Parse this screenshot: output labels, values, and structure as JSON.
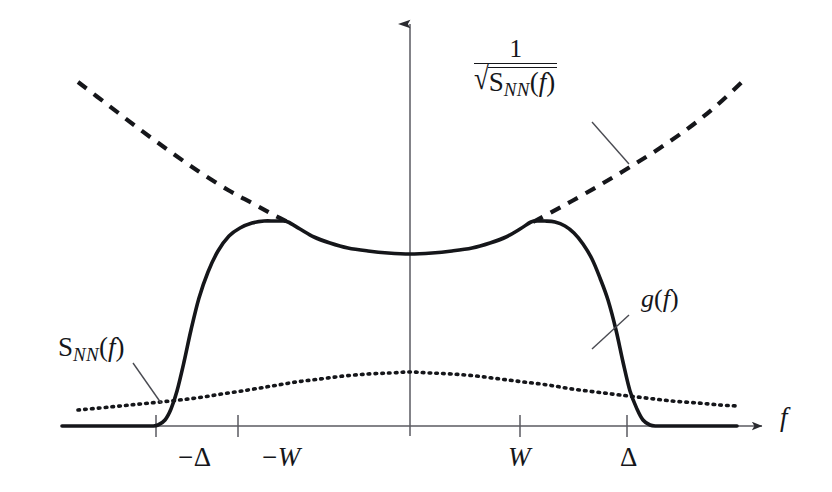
{
  "figure": {
    "background_color": "#ffffff",
    "ink_color": "#15161a",
    "axis_color": "#5a5a60",
    "width": 832,
    "height": 492
  },
  "axes": {
    "x_axis_label": "f",
    "x_axis_label_style": "italic",
    "origin_px": {
      "x": 410,
      "y": 426
    },
    "x_axis_span_px": {
      "x1": 62,
      "x2": 762
    },
    "y_axis_span_px": {
      "y1": 24,
      "y2": 436
    },
    "ticks": [
      {
        "name": "minus-delta",
        "label_minus": "−",
        "label_symbol": "Δ",
        "upright": true,
        "x_px": 156,
        "label_x_px": 178,
        "label_y_px": 444
      },
      {
        "name": "minus-w",
        "label_minus": "−",
        "label_symbol": "W",
        "upright": false,
        "x_px": 238,
        "label_x_px": 262,
        "label_y_px": 444
      },
      {
        "name": "w",
        "label_minus": "",
        "label_symbol": "W",
        "upright": false,
        "x_px": 520,
        "label_x_px": 508,
        "label_y_px": 444
      },
      {
        "name": "delta",
        "label_minus": "",
        "label_symbol": "Δ",
        "upright": true,
        "x_px": 627,
        "label_x_px": 620,
        "label_y_px": 444
      }
    ]
  },
  "labels": {
    "envelope": {
      "name": "inverse-sqrt-snn-label",
      "numerator": "1",
      "radical_sign": "√",
      "denominator_base": "S",
      "denominator_sub": "NN",
      "denominator_open_paren": "(",
      "denominator_arg": "f",
      "denominator_close_paren": ")",
      "x_px": 474,
      "y_px": 36,
      "leader": {
        "x1": 592,
        "y1": 122,
        "x2": 629,
        "y2": 164
      }
    },
    "noise": {
      "name": "snn-label",
      "base": "S",
      "sub": "NN",
      "open_paren": "(",
      "arg": "f",
      "close_paren": ")",
      "x_px": 58,
      "y_px": 334,
      "leader": {
        "x1": 133,
        "y1": 363,
        "x2": 161,
        "y2": 403
      }
    },
    "filter": {
      "name": "g-of-f-label",
      "fn_name": "g",
      "open_paren": "(",
      "arg": "f",
      "close_paren": ")",
      "x_px": 641,
      "y_px": 286,
      "leader": {
        "x1": 629,
        "y1": 315,
        "x2": 592,
        "y2": 349
      }
    }
  },
  "chart_data": {
    "type": "line",
    "title": "",
    "xlabel": "f",
    "ylabel": "",
    "grid": false,
    "legend": "none",
    "x_tick_labels": [
      "−Δ",
      "−W",
      "W",
      "Δ"
    ],
    "x_tick_values": [
      -1.62,
      -0.84,
      0.84,
      1.62
    ],
    "xlim": [
      -2.45,
      2.45
    ],
    "ylim": [
      0,
      1
    ],
    "series": [
      {
        "name": "g(f)",
        "style": "solid",
        "stroke_width": 3.6,
        "description": "filter magnitude response; zero outside +/-Delta, steep sigmoid edges, shallow U-shaped top between -W and W",
        "points_px": [
          [
            62,
            426
          ],
          [
            100,
            426
          ],
          [
            140,
            426
          ],
          [
            152,
            426
          ],
          [
            158,
            425
          ],
          [
            165,
            420
          ],
          [
            171,
            409
          ],
          [
            177,
            391
          ],
          [
            184,
            362
          ],
          [
            191,
            330
          ],
          [
            199,
            298
          ],
          [
            208,
            272
          ],
          [
            218,
            251
          ],
          [
            229,
            236
          ],
          [
            240,
            228
          ],
          [
            252,
            223
          ],
          [
            264,
            221
          ],
          [
            274,
            221
          ],
          [
            282,
            221
          ],
          [
            288,
            222
          ],
          [
            300,
            229
          ],
          [
            314,
            237
          ],
          [
            330,
            243
          ],
          [
            348,
            248
          ],
          [
            368,
            251
          ],
          [
            388,
            253
          ],
          [
            410,
            254
          ],
          [
            432,
            253
          ],
          [
            452,
            251
          ],
          [
            472,
            248
          ],
          [
            490,
            243
          ],
          [
            506,
            237
          ],
          [
            520,
            229
          ],
          [
            531,
            222
          ],
          [
            537,
            221
          ],
          [
            545,
            221
          ],
          [
            555,
            222
          ],
          [
            565,
            226
          ],
          [
            574,
            233
          ],
          [
            583,
            244
          ],
          [
            592,
            259
          ],
          [
            600,
            278
          ],
          [
            608,
            300
          ],
          [
            616,
            330
          ],
          [
            623,
            362
          ],
          [
            630,
            391
          ],
          [
            637,
            409
          ],
          [
            643,
            420
          ],
          [
            650,
            425
          ],
          [
            657,
            426
          ],
          [
            672,
            426
          ],
          [
            700,
            426
          ],
          [
            737,
            426
          ]
        ]
      },
      {
        "name": "1/sqrt(S_NN(f))",
        "style": "dashed",
        "stroke_width": 4.2,
        "dash_pattern": "11 9",
        "description": "water-filling envelope; rises away from the band centre on both sides, tangent to g(f) at -W and W",
        "segments_px": [
          [
            [
              78,
              82
            ],
            [
              108,
              105
            ],
            [
              138,
              128
            ],
            [
              168,
              150
            ],
            [
              198,
              171
            ],
            [
              228,
              190
            ],
            [
              252,
              203
            ],
            [
              272,
              214
            ],
            [
              288,
              222
            ]
          ],
          [
            [
              533,
              222
            ],
            [
              550,
              213
            ],
            [
              572,
              201
            ],
            [
              600,
              185
            ],
            [
              630,
              167
            ],
            [
              660,
              148
            ],
            [
              690,
              127
            ],
            [
              716,
              106
            ],
            [
              742,
              82
            ]
          ]
        ]
      },
      {
        "name": "S_NN(f)",
        "style": "dotted",
        "stroke_width": 3.6,
        "dash_pattern": "1.6 5.2",
        "description": "noise power spectral density; broad gentle hump peaking at f = 0",
        "points_px": [
          [
            78,
            410
          ],
          [
            110,
            407
          ],
          [
            140,
            404
          ],
          [
            170,
            401
          ],
          [
            196,
            398
          ],
          [
            222,
            394
          ],
          [
            248,
            390
          ],
          [
            272,
            386
          ],
          [
            296,
            382
          ],
          [
            320,
            379
          ],
          [
            344,
            376
          ],
          [
            368,
            374
          ],
          [
            390,
            373
          ],
          [
            410,
            372
          ],
          [
            430,
            373
          ],
          [
            452,
            374
          ],
          [
            476,
            376
          ],
          [
            500,
            379
          ],
          [
            524,
            382
          ],
          [
            548,
            385
          ],
          [
            572,
            389
          ],
          [
            596,
            392
          ],
          [
            620,
            395
          ],
          [
            646,
            398
          ],
          [
            672,
            401
          ],
          [
            698,
            403
          ],
          [
            720,
            405
          ],
          [
            737,
            406
          ]
        ]
      }
    ]
  }
}
